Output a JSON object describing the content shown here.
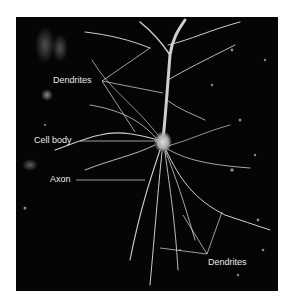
{
  "figure": {
    "labels": {
      "dendrites_top": "Dendrites",
      "cell_body": "Cell body",
      "axon": "Axon",
      "dendrites_bottom": "Dendrites"
    },
    "colors": {
      "background": "#050505",
      "neuron": "#d8d8d8",
      "label": "#e8e8e8",
      "page": "#ffffff"
    }
  }
}
